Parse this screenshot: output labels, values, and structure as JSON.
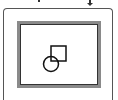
{
  "frame": {
    "outer_border_color": "#555555",
    "inner_border_color": "#8a8a8a",
    "inner_outline_color": "#333333",
    "background": "#ffffff"
  },
  "icon": {
    "name": "shapes-icon",
    "description": "circle overlapping square",
    "stroke_color": "#111111"
  }
}
